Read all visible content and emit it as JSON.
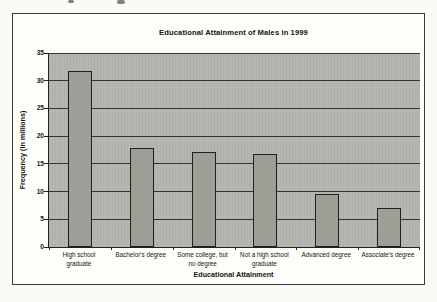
{
  "chart_data": {
    "type": "bar",
    "title": "Educational Attainment of Males in 1999",
    "xlabel": "Educational Attainment",
    "ylabel": "Frequency (in millions)",
    "categories": [
      "High school\ngraduate",
      "Bachelor's degree",
      "Some college, but\nno degree",
      "Not a high school\ngraduate",
      "Advanced degree",
      "Associate's degree"
    ],
    "values": [
      31.8,
      17.9,
      17.2,
      16.7,
      9.6,
      7.0
    ],
    "ylim": [
      0,
      35
    ],
    "yticks": [
      0,
      5,
      10,
      15,
      20,
      25,
      30,
      35
    ],
    "ytick_step": 5,
    "grid": true,
    "legend": "none",
    "colors": {
      "plot_bg": "#b5b5af",
      "bar_fill": "#9e9e97",
      "bar_border": "#1f1f1c",
      "grid": "#32322e",
      "axis": "#22221f",
      "frame_border": "#3a3a36",
      "text": "#151513"
    }
  }
}
